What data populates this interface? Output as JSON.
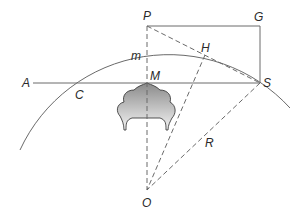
{
  "diagram": {
    "type": "geometry-construction",
    "labels": {
      "P": "P",
      "G": "G",
      "H": "H",
      "m": "m",
      "A": "A",
      "M": "M",
      "S": "S",
      "C": "C",
      "R": "R",
      "O": "O"
    },
    "points": {
      "P": [
        147,
        26
      ],
      "G": [
        260,
        26
      ],
      "S": [
        260,
        83
      ],
      "M": [
        147,
        83
      ],
      "A": [
        33,
        83
      ],
      "O": [
        147,
        190
      ],
      "H": [
        205,
        48
      ]
    },
    "edges": {
      "solid": [
        "P-G",
        "G-S",
        "A-S",
        "arc through A-P-S"
      ],
      "dashed": [
        "P-O",
        "P-S",
        "S-O",
        "H-O"
      ]
    },
    "colors": {
      "line": "#6a6a6a",
      "text": "#2a2a2a",
      "cloud_dark": "#8a8a8a",
      "cloud_light": "#f2f2f2"
    }
  }
}
